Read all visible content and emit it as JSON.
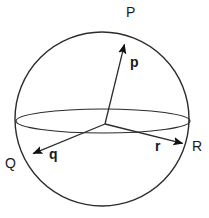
{
  "figure": {
    "kind": "sphere-vector-diagram",
    "background_color": "#ffffff",
    "stroke_color": "#2b2b2b",
    "fill_color": "#111111",
    "width": 209,
    "height": 218
  },
  "sphere": {
    "name": "outer-sphere-outline",
    "center_x": 102,
    "center_y": 119,
    "radius": 87,
    "stroke_width": 1.4
  },
  "equator": {
    "name": "equator-ellipse",
    "center_x": 103,
    "center_y": 121,
    "rx": 87,
    "ry": 12,
    "stroke_width": 1.2
  },
  "origin": {
    "x": 105,
    "y": 124
  },
  "vectors": [
    {
      "id": "p",
      "vector_label": "p",
      "point_label": "P",
      "from_x": 105,
      "from_y": 124,
      "to_x": 126,
      "to_y": 38,
      "vector_label_x": 130,
      "vector_label_y": 55,
      "point_label_x": 126,
      "point_label_y": 5
    },
    {
      "id": "q",
      "vector_label": "q",
      "point_label": "Q",
      "from_x": 105,
      "from_y": 124,
      "to_x": 27,
      "to_y": 156,
      "vector_label_x": 49,
      "vector_label_y": 147,
      "point_label_x": 5,
      "point_label_y": 156
    },
    {
      "id": "r",
      "vector_label": "r",
      "point_label": "R",
      "from_x": 105,
      "from_y": 124,
      "to_x": 189,
      "to_y": 145,
      "vector_label_x": 155,
      "vector_label_y": 139,
      "point_label_x": 192,
      "point_label_y": 139
    }
  ]
}
